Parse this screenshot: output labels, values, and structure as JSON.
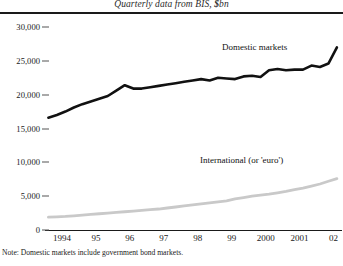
{
  "subtitle": {
    "prefix": "Quarterly data from BIS,",
    "currency": "$",
    "suffix": "bn"
  },
  "footnote": "Note: Domestic markets include government bond markets.",
  "series_labels": {
    "domestic": "Domestic markets",
    "international": "International (or 'euro')"
  },
  "colors": {
    "domestic": "#111111",
    "international": "#c9c9c9",
    "axis": "#1a1a1a",
    "background": "#ffffff"
  },
  "chart_data": {
    "type": "line",
    "title": "",
    "subtitle": "Quarterly data from BIS, $bn",
    "xlabel": "",
    "ylabel": "",
    "grid": false,
    "legend": "inline-labels",
    "ylim": [
      0,
      30000
    ],
    "yticks": [
      0,
      5000,
      10000,
      15000,
      20000,
      25000,
      30000
    ],
    "ytick_labels": [
      "0",
      "5,000",
      "10,000",
      "15,000",
      "20,000",
      "25,000",
      "30,000"
    ],
    "xticks": [
      1994,
      1995,
      1996,
      1997,
      1998,
      1999,
      2000,
      2001,
      2002
    ],
    "xtick_labels": [
      "1994",
      "95",
      "96",
      "97",
      "98",
      "99",
      "2000",
      "2001",
      "02"
    ],
    "xlim": [
      1993.5,
      2002.25
    ],
    "x": [
      1993.6,
      1993.85,
      1994.1,
      1994.35,
      1994.6,
      1994.85,
      1995.1,
      1995.35,
      1995.6,
      1995.85,
      1996.1,
      1996.35,
      1996.6,
      1996.85,
      1997.1,
      1997.35,
      1997.6,
      1997.85,
      1998.1,
      1998.35,
      1998.6,
      1998.85,
      1999.1,
      1999.35,
      1999.6,
      1999.85,
      2000.1,
      2000.35,
      2000.6,
      2000.85,
      2001.1,
      2001.35,
      2001.6,
      2001.85,
      2002.1
    ],
    "series": [
      {
        "name": "Domestic markets",
        "color": "#111111",
        "values": [
          16600,
          17000,
          17500,
          18100,
          18600,
          19000,
          19400,
          19800,
          20600,
          21400,
          20900,
          20900,
          21100,
          21300,
          21500,
          21700,
          21900,
          22100,
          22300,
          22100,
          22500,
          22400,
          22300,
          22700,
          22800,
          22600,
          23600,
          23800,
          23600,
          23700,
          23700,
          24300,
          24100,
          24600,
          27000
        ]
      },
      {
        "name": "International (or 'euro')",
        "color": "#c9c9c9",
        "values": [
          1900,
          1950,
          2000,
          2100,
          2200,
          2300,
          2400,
          2500,
          2600,
          2700,
          2800,
          2900,
          3000,
          3100,
          3250,
          3400,
          3550,
          3700,
          3850,
          4000,
          4150,
          4300,
          4600,
          4800,
          5000,
          5150,
          5300,
          5500,
          5700,
          5950,
          6200,
          6500,
          6800,
          7200,
          7600
        ]
      }
    ]
  }
}
